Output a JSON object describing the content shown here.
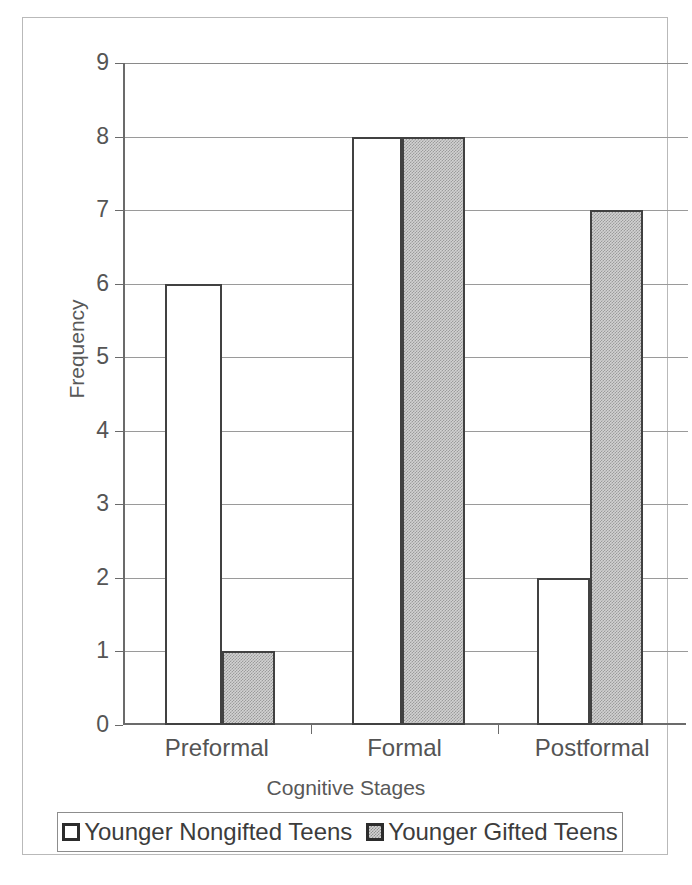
{
  "chart_data": {
    "type": "bar",
    "title": "",
    "xlabel": "Cognitive Stages",
    "ylabel": "Frequency",
    "categories": [
      "Preformal",
      "Formal",
      "Postformal"
    ],
    "series": [
      {
        "name": "Younger Nongifted Teens",
        "values": [
          6,
          8,
          2
        ],
        "fill": "#ffffff",
        "border": "#414141"
      },
      {
        "name": "Younger Gifted Teens",
        "values": [
          1,
          8,
          7
        ],
        "fill": "#d2d2d2",
        "border": "#414141"
      }
    ],
    "ylim": [
      0,
      9
    ],
    "yticks": [
      "0",
      "1",
      "2",
      "3",
      "4",
      "5",
      "6",
      "7",
      "8",
      "9"
    ],
    "grid": true,
    "legend_position": "bottom",
    "legend_swatches": [
      "legend-swatch-nongifted",
      "legend-swatch-gifted"
    ]
  },
  "axes": {
    "y_title": "Frequency",
    "x_title": "Cognitive Stages",
    "y_tick_labels": [
      "9",
      "8",
      "7",
      "6",
      "5",
      "4",
      "3",
      "2",
      "1",
      "0"
    ],
    "x_tick_labels": [
      "Preformal",
      "Formal",
      "Postformal"
    ]
  },
  "legend": {
    "entries": [
      {
        "label": "Younger Nongifted Teens"
      },
      {
        "label": "Younger Gifted Teens"
      }
    ]
  }
}
